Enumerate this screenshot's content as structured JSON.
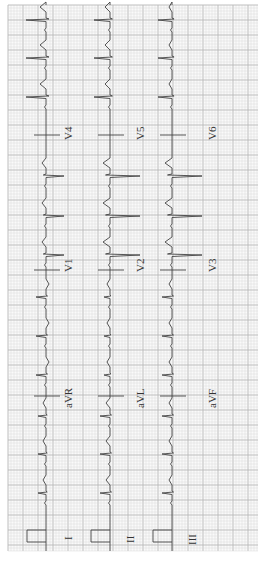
{
  "chart_data": {
    "type": "ecg",
    "orientation": "rotated-90-clockwise",
    "paper": {
      "background": "#ffffff",
      "grid_minor_color": "#d9d9d9",
      "grid_major_color": "#b8b8b8",
      "trace_color": "#444444",
      "minor_px": 3,
      "major_px": 15,
      "bounds": {
        "x0": 8,
        "y0": 5,
        "x1": 258,
        "y1": 551
      }
    },
    "rows": [
      {
        "baseline_x": 46,
        "leads": [
          "I",
          "aVR",
          "V1",
          "V4"
        ]
      },
      {
        "baseline_x": 110,
        "leads": [
          "II",
          "aVL",
          "V2",
          "V5"
        ]
      },
      {
        "baseline_x": 172,
        "leads": [
          "III",
          "aVF",
          "V3",
          "V6"
        ]
      }
    ],
    "segments_y": [
      [
        551,
        396
      ],
      [
        396,
        270
      ],
      [
        270,
        135
      ],
      [
        135,
        5
      ]
    ],
    "beat_y": [
      20,
      58,
      97,
      136,
      176,
      216,
      255,
      297,
      336,
      375,
      416,
      454,
      493
    ],
    "lead_morphology": {
      "I": {
        "qrs": 8,
        "t": 3
      },
      "aVR": {
        "qrs": 10,
        "t": -3
      },
      "V1": {
        "qrs": -18,
        "t": 4
      },
      "V4": {
        "qrs": 20,
        "t": 6
      },
      "II": {
        "qrs": 10,
        "t": 4
      },
      "aVL": {
        "qrs": 6,
        "t": 3
      },
      "V2": {
        "qrs": -30,
        "t": 7
      },
      "V5": {
        "qrs": 16,
        "t": 5
      },
      "III": {
        "qrs": 10,
        "t": 3
      },
      "aVF": {
        "qrs": 10,
        "t": 3
      },
      "V3": {
        "qrs": -30,
        "t": 7
      },
      "V6": {
        "qrs": 14,
        "t": 3
      }
    },
    "calibration": [
      {
        "x": 27,
        "y0": 530,
        "y1": 542
      },
      {
        "x": 91,
        "y0": 530,
        "y1": 542
      },
      {
        "x": 153,
        "y0": 530,
        "y1": 542
      }
    ],
    "labels": [
      {
        "text": "I",
        "x": 62,
        "y": 540
      },
      {
        "text": "II",
        "x": 124,
        "y": 543
      },
      {
        "text": "III",
        "x": 186,
        "y": 545
      },
      {
        "text": "aVR",
        "x": 62,
        "y": 408
      },
      {
        "text": "aVL",
        "x": 134,
        "y": 408
      },
      {
        "text": "aVF",
        "x": 206,
        "y": 408
      },
      {
        "text": "V1",
        "x": 62,
        "y": 272
      },
      {
        "text": "V2",
        "x": 134,
        "y": 272
      },
      {
        "text": "V3",
        "x": 206,
        "y": 272
      },
      {
        "text": "V4",
        "x": 62,
        "y": 140
      },
      {
        "text": "V5",
        "x": 134,
        "y": 140
      },
      {
        "text": "V6",
        "x": 206,
        "y": 140
      }
    ]
  }
}
